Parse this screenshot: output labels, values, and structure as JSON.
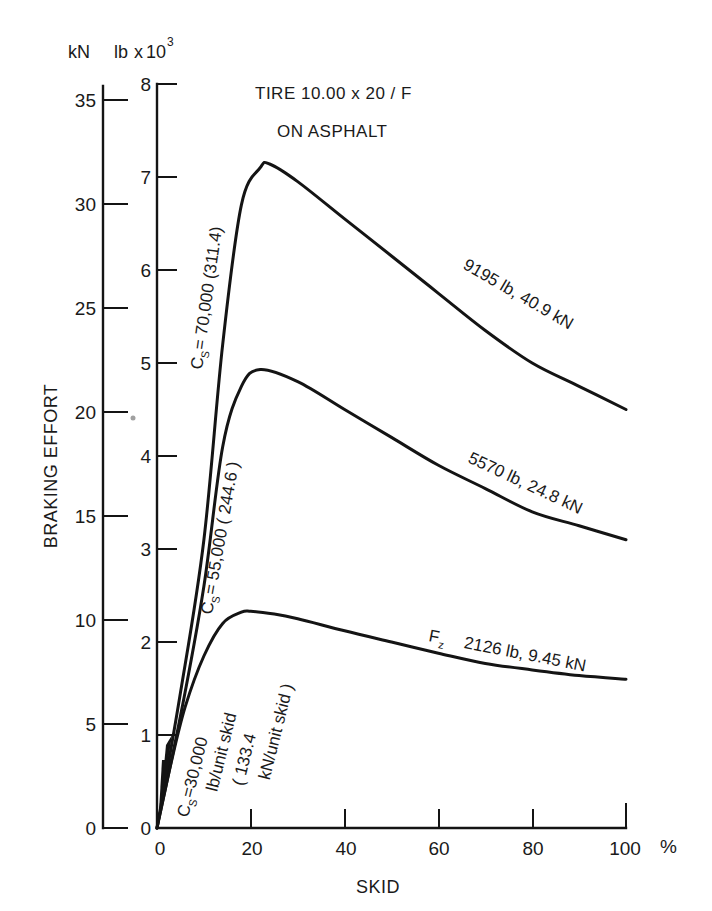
{
  "chart_data": {
    "type": "line",
    "title": "TIRE 10.00 x 20 / F",
    "subtitle": "ON ASPHALT",
    "xlabel": "SKID",
    "x_unit": "%",
    "ylabel": "BRAKING EFFORT",
    "y_units": {
      "left_outer": "kN",
      "left_inner": "lb x 10^3"
    },
    "xlim": [
      0,
      100
    ],
    "ylim_lb_x1000": [
      0,
      8
    ],
    "ylim_kN": [
      0,
      35.6
    ],
    "x_ticks": [
      0,
      20,
      40,
      60,
      80,
      100
    ],
    "y_ticks_lb_x1000": [
      0,
      1,
      2,
      3,
      4,
      5,
      6,
      7,
      8
    ],
    "y_ticks_kN": [
      0,
      5,
      10,
      15,
      20,
      25,
      30,
      35
    ],
    "grid": false,
    "legend": "none (curves labeled inline)",
    "series": [
      {
        "name": "Fz 9195 lb, 40.9 kN",
        "load_lb": 9195,
        "load_kN": 40.9,
        "cornering_stiffness_label": "Cs = 70,000 (311.4)",
        "x": [
          0,
          5,
          10,
          14,
          18,
          22,
          24,
          30,
          40,
          50,
          60,
          70,
          80,
          90,
          100
        ],
        "y_lb_x1000": [
          0,
          1.45,
          3.1,
          5.2,
          6.7,
          7.1,
          7.14,
          6.95,
          6.55,
          6.15,
          5.75,
          5.35,
          5.0,
          4.75,
          4.5
        ]
      },
      {
        "name": "Fz 5570 lb, 24.8 kN",
        "load_lb": 5570,
        "load_kN": 24.8,
        "cornering_stiffness_label": "Cs = 55,000 (244.6)",
        "x": [
          0,
          5,
          10,
          14,
          18,
          22,
          30,
          40,
          50,
          60,
          70,
          80,
          90,
          100
        ],
        "y_lb_x1000": [
          0,
          1.2,
          2.6,
          4.1,
          4.75,
          4.93,
          4.8,
          4.5,
          4.2,
          3.9,
          3.65,
          3.4,
          3.25,
          3.1
        ]
      },
      {
        "name": "Fz 2126 lb, 9.45 kN",
        "load_lb": 2126,
        "load_kN": 9.45,
        "cornering_stiffness_label": "Cs = 30,000 lb/unit skid (133.4 kN/unit skid)",
        "x": [
          0,
          3,
          6,
          10,
          14,
          18,
          20,
          25,
          30,
          40,
          50,
          60,
          70,
          80,
          90,
          100
        ],
        "y_lb_x1000": [
          0,
          0.7,
          1.3,
          1.85,
          2.2,
          2.32,
          2.33,
          2.3,
          2.25,
          2.12,
          2.0,
          1.88,
          1.77,
          1.7,
          1.64,
          1.6
        ]
      }
    ]
  },
  "labels": {
    "unit_kN": "kN",
    "unit_lb": "lb",
    "unit_lb_x": "x",
    "unit_lb_ten": "10",
    "unit_lb_exp": "3",
    "title_line1": "TIRE  10.00 x 20 / F",
    "title_line2": "ON   ASPHALT",
    "y_axis_title": "BRAKING  EFFORT",
    "x_axis_title": "SKID",
    "x_unit": "%",
    "x_ticks": [
      "0",
      "20",
      "40",
      "60",
      "80",
      "100"
    ],
    "lb_ticks": [
      "0",
      "1",
      "2",
      "3",
      "4",
      "5",
      "6",
      "7",
      "8"
    ],
    "kN_ticks": [
      "0",
      "5",
      "10",
      "15",
      "20",
      "25",
      "30",
      "35"
    ],
    "curve1_load": "9195 lb,   40.9 kN",
    "curve2_load": "5570 lb,   24.8 kN",
    "curve3_fz": "F",
    "curve3_fz_sub": "z",
    "curve3_load": "2126 lb,   9.45 kN",
    "cs1_C": "C",
    "cs1_sub": "S",
    "cs1_val": "= 70,000   (311.4)",
    "cs2_C": "C",
    "cs2_sub": "S",
    "cs2_val": "= 55,000  ( 244.6 )",
    "cs3_C": "C",
    "cs3_sub": "S",
    "cs3_val": "=30,000",
    "cs3_line2": "lb/unit  skid",
    "cs3_line3": "( 133.4",
    "cs3_line4": "kN/unit skid )"
  }
}
